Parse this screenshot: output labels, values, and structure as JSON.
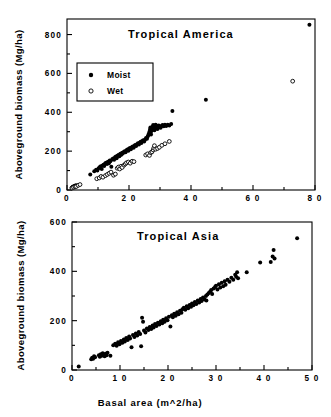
{
  "figure": {
    "background": "#ffffff",
    "ink": "#000000"
  },
  "chart_data": [
    {
      "type": "scatter",
      "id": "tropical-america",
      "title": "Tropical   America",
      "xlabel": "",
      "ylabel": "Aboveground  biomass  (Mg/ha)",
      "xlim": [
        0,
        80
      ],
      "ylim": [
        0,
        880
      ],
      "xticks": [
        0,
        20,
        40,
        60,
        80
      ],
      "xtick_labels": [
        "0",
        "2 0",
        "4 0",
        "6 0",
        "8 0"
      ],
      "yticks": [
        0,
        200,
        400,
        600,
        800
      ],
      "ytick_labels": [
        "0",
        "200",
        "400",
        "600",
        "800"
      ],
      "xminor_step": 10,
      "yminor_step": 100,
      "grid": false,
      "legend": {
        "position": "upper-left-inset",
        "entries": [
          {
            "label": "Moist",
            "marker": "filled-circle"
          },
          {
            "label": "Wet",
            "marker": "open-circle"
          }
        ]
      },
      "series": [
        {
          "name": "Moist",
          "marker": "filled-circle",
          "points": [
            [
              1.5,
              12
            ],
            [
              1.8,
              15
            ],
            [
              2.0,
              18
            ],
            [
              2.2,
              14
            ],
            [
              2.4,
              20
            ],
            [
              2.6,
              22
            ],
            [
              2.9,
              24
            ],
            [
              3.1,
              20
            ],
            [
              7.5,
              80
            ],
            [
              8.8,
              96
            ],
            [
              9.4,
              104
            ],
            [
              9.8,
              100
            ],
            [
              10.2,
              112
            ],
            [
              10.6,
              118
            ],
            [
              10.9,
              122
            ],
            [
              11.2,
              108
            ],
            [
              11.5,
              126
            ],
            [
              11.8,
              130
            ],
            [
              12.0,
              124
            ],
            [
              12.3,
              136
            ],
            [
              12.6,
              140
            ],
            [
              12.9,
              134
            ],
            [
              13.2,
              146
            ],
            [
              13.5,
              138
            ],
            [
              13.8,
              152
            ],
            [
              14.0,
              148
            ],
            [
              14.3,
              120
            ],
            [
              14.6,
              158
            ],
            [
              14.9,
              162
            ],
            [
              15.2,
              156
            ],
            [
              15.5,
              168
            ],
            [
              15.8,
              172
            ],
            [
              16.0,
              164
            ],
            [
              16.3,
              176
            ],
            [
              16.6,
              180
            ],
            [
              16.9,
              174
            ],
            [
              17.2,
              186
            ],
            [
              17.5,
              182
            ],
            [
              17.8,
              192
            ],
            [
              18.0,
              188
            ],
            [
              18.3,
              196
            ],
            [
              18.6,
              200
            ],
            [
              18.9,
              194
            ],
            [
              19.2,
              204
            ],
            [
              19.5,
              208
            ],
            [
              19.8,
              202
            ],
            [
              20.0,
              212
            ],
            [
              20.3,
              216
            ],
            [
              20.6,
              210
            ],
            [
              20.9,
              220
            ],
            [
              21.2,
              224
            ],
            [
              21.5,
              218
            ],
            [
              21.8,
              228
            ],
            [
              22.0,
              232
            ],
            [
              22.3,
              226
            ],
            [
              22.6,
              236
            ],
            [
              22.9,
              240
            ],
            [
              23.2,
              234
            ],
            [
              23.5,
              244
            ],
            [
              23.8,
              248
            ],
            [
              24.0,
              242
            ],
            [
              24.3,
              252
            ],
            [
              24.6,
              256
            ],
            [
              24.9,
              250
            ],
            [
              25.2,
              260
            ],
            [
              25.5,
              268
            ],
            [
              25.8,
              264
            ],
            [
              26.0,
              274
            ],
            [
              26.2,
              282
            ],
            [
              26.4,
              290
            ],
            [
              26.6,
              300
            ],
            [
              26.8,
              312
            ],
            [
              26.9,
              322
            ],
            [
              27.0,
              296
            ],
            [
              27.1,
              286
            ],
            [
              27.3,
              306
            ],
            [
              27.5,
              316
            ],
            [
              27.6,
              326
            ],
            [
              27.8,
              334
            ],
            [
              28.0,
              318
            ],
            [
              28.2,
              308
            ],
            [
              28.4,
              328
            ],
            [
              28.6,
              336
            ],
            [
              28.8,
              322
            ],
            [
              29.0,
              330
            ],
            [
              29.2,
              314
            ],
            [
              29.4,
              324
            ],
            [
              29.6,
              332
            ],
            [
              29.9,
              326
            ],
            [
              30.2,
              320
            ],
            [
              30.5,
              330
            ],
            [
              30.8,
              334
            ],
            [
              31.2,
              328
            ],
            [
              31.6,
              336
            ],
            [
              32.0,
              330
            ],
            [
              32.5,
              336
            ],
            [
              33.0,
              332
            ],
            [
              33.6,
              340
            ],
            [
              34.0,
              406
            ],
            [
              44.8,
              465
            ],
            [
              78.2,
              850
            ]
          ]
        },
        {
          "name": "Wet",
          "marker": "open-circle",
          "points": [
            [
              1.6,
              10
            ],
            [
              2.1,
              14
            ],
            [
              2.6,
              16
            ],
            [
              3.0,
              18
            ],
            [
              3.6,
              24
            ],
            [
              4.2,
              28
            ],
            [
              9.6,
              58
            ],
            [
              10.4,
              62
            ],
            [
              11.0,
              70
            ],
            [
              11.6,
              66
            ],
            [
              12.4,
              74
            ],
            [
              13.0,
              80
            ],
            [
              13.6,
              86
            ],
            [
              14.2,
              92
            ],
            [
              15.0,
              76
            ],
            [
              15.6,
              82
            ],
            [
              16.2,
              112
            ],
            [
              16.6,
              118
            ],
            [
              17.0,
              108
            ],
            [
              17.4,
              122
            ],
            [
              17.8,
              116
            ],
            [
              18.4,
              128
            ],
            [
              18.8,
              134
            ],
            [
              19.2,
              140
            ],
            [
              19.8,
              144
            ],
            [
              20.4,
              138
            ],
            [
              21.0,
              148
            ],
            [
              21.6,
              146
            ],
            [
              25.4,
              180
            ],
            [
              26.0,
              186
            ],
            [
              26.6,
              178
            ],
            [
              27.0,
              192
            ],
            [
              27.4,
              196
            ],
            [
              27.8,
              206
            ],
            [
              28.0,
              216
            ],
            [
              28.2,
              228
            ],
            [
              28.6,
              210
            ],
            [
              29.2,
              214
            ],
            [
              29.8,
              220
            ],
            [
              30.6,
              230
            ],
            [
              31.6,
              238
            ],
            [
              33.0,
              250
            ],
            [
              72.8,
              560
            ]
          ]
        }
      ]
    },
    {
      "type": "scatter",
      "id": "tropical-asia",
      "title": "Tropical   Asia",
      "xlabel": "Basal   area   (m^2/ha)",
      "ylabel": "Aboveground  biomass  (Mg/ha)",
      "xlim": [
        0,
        50
      ],
      "ylim": [
        0,
        600
      ],
      "xticks": [
        0,
        10,
        20,
        30,
        40,
        50
      ],
      "xtick_labels": [
        "0",
        "1 0",
        "2 0",
        "3 0",
        "4 0",
        "5 0"
      ],
      "yticks": [
        0,
        200,
        400,
        600
      ],
      "ytick_labels": [
        "0",
        "200",
        "400",
        "600"
      ],
      "xminor_step": 5,
      "yminor_step": 100,
      "grid": false,
      "legend": null,
      "series": [
        {
          "name": "Asia",
          "marker": "filled-circle",
          "points": [
            [
              1.4,
              14
            ],
            [
              4.0,
              44
            ],
            [
              4.2,
              50
            ],
            [
              4.4,
              46
            ],
            [
              4.6,
              56
            ],
            [
              4.8,
              52
            ],
            [
              5.6,
              60
            ],
            [
              5.8,
              54
            ],
            [
              6.0,
              64
            ],
            [
              6.2,
              58
            ],
            [
              6.4,
              68
            ],
            [
              6.6,
              62
            ],
            [
              6.8,
              56
            ],
            [
              7.0,
              66
            ],
            [
              7.2,
              60
            ],
            [
              7.4,
              70
            ],
            [
              8.0,
              58
            ],
            [
              8.6,
              100
            ],
            [
              9.0,
              106
            ],
            [
              9.3,
              98
            ],
            [
              9.6,
              112
            ],
            [
              9.9,
              104
            ],
            [
              10.2,
              118
            ],
            [
              10.5,
              110
            ],
            [
              10.8,
              124
            ],
            [
              11.0,
              116
            ],
            [
              11.3,
              130
            ],
            [
              11.6,
              122
            ],
            [
              11.9,
              136
            ],
            [
              12.1,
              128
            ],
            [
              12.4,
              92
            ],
            [
              12.7,
              142
            ],
            [
              13.0,
              134
            ],
            [
              13.3,
              148
            ],
            [
              13.6,
              140
            ],
            [
              13.9,
              154
            ],
            [
              14.2,
              146
            ],
            [
              14.4,
              96
            ],
            [
              14.6,
              212
            ],
            [
              14.8,
              196
            ],
            [
              15.0,
              160
            ],
            [
              15.3,
              152
            ],
            [
              15.6,
              168
            ],
            [
              15.9,
              162
            ],
            [
              16.2,
              174
            ],
            [
              16.5,
              166
            ],
            [
              16.8,
              180
            ],
            [
              17.0,
              172
            ],
            [
              17.3,
              186
            ],
            [
              17.6,
              178
            ],
            [
              17.9,
              192
            ],
            [
              18.2,
              184
            ],
            [
              18.5,
              198
            ],
            [
              18.8,
              190
            ],
            [
              19.0,
              204
            ],
            [
              19.3,
              196
            ],
            [
              19.6,
              210
            ],
            [
              19.9,
              202
            ],
            [
              20.2,
              216
            ],
            [
              20.5,
              176
            ],
            [
              20.8,
              222
            ],
            [
              21.0,
              214
            ],
            [
              21.3,
              228
            ],
            [
              21.6,
              220
            ],
            [
              21.9,
              234
            ],
            [
              22.2,
              226
            ],
            [
              22.5,
              240
            ],
            [
              22.8,
              232
            ],
            [
              23.0,
              246
            ],
            [
              23.3,
              252
            ],
            [
              23.6,
              244
            ],
            [
              23.9,
              258
            ],
            [
              24.2,
              250
            ],
            [
              24.5,
              264
            ],
            [
              24.8,
              256
            ],
            [
              25.0,
              270
            ],
            [
              25.3,
              262
            ],
            [
              25.6,
              276
            ],
            [
              25.9,
              268
            ],
            [
              26.2,
              282
            ],
            [
              26.5,
              274
            ],
            [
              26.8,
              288
            ],
            [
              27.0,
              280
            ],
            [
              27.3,
              294
            ],
            [
              27.6,
              286
            ],
            [
              27.9,
              300
            ],
            [
              28.0,
              282
            ],
            [
              28.2,
              306
            ],
            [
              28.5,
              312
            ],
            [
              28.8,
              318
            ],
            [
              29.0,
              324
            ],
            [
              29.2,
              308
            ],
            [
              29.5,
              330
            ],
            [
              29.8,
              336
            ],
            [
              30.0,
              342
            ],
            [
              30.3,
              326
            ],
            [
              30.6,
              348
            ],
            [
              30.9,
              334
            ],
            [
              31.2,
              354
            ],
            [
              31.5,
              340
            ],
            [
              31.8,
              360
            ],
            [
              32.0,
              346
            ],
            [
              32.4,
              366
            ],
            [
              32.8,
              358
            ],
            [
              33.2,
              374
            ],
            [
              33.6,
              366
            ],
            [
              34.0,
              386
            ],
            [
              34.2,
              378
            ],
            [
              34.4,
              396
            ],
            [
              34.6,
              372
            ],
            [
              36.4,
              396
            ],
            [
              39.2,
              436
            ],
            [
              41.4,
              438
            ],
            [
              41.8,
              460
            ],
            [
              42.0,
              486
            ],
            [
              42.2,
              452
            ],
            [
              46.9,
              534
            ]
          ]
        }
      ]
    }
  ]
}
